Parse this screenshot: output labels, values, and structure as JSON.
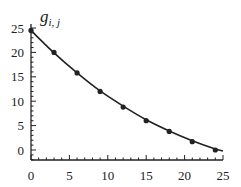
{
  "chart_data": {
    "type": "line",
    "title": "",
    "xlabel": "",
    "ylabel": "g_{i,j}",
    "ylabel_main": "g",
    "ylabel_sub": "i, j",
    "xlim": [
      0,
      25
    ],
    "ylim": [
      -2,
      25
    ],
    "grid": false,
    "legend": "none",
    "x_ticks": [
      0,
      5,
      10,
      15,
      20,
      25
    ],
    "y_ticks": [
      0,
      5,
      10,
      15,
      20,
      25
    ],
    "x_tick_labels": [
      "0",
      "5",
      "10",
      "15",
      "20",
      "25"
    ],
    "y_tick_labels": [
      "0",
      "5",
      "10",
      "15",
      "20",
      "25"
    ],
    "series": [
      {
        "name": "data points",
        "kind": "scatter",
        "x": [
          0,
          3,
          6,
          9,
          12,
          15,
          18,
          21,
          24
        ],
        "values": [
          24.5,
          20.0,
          15.8,
          12.0,
          8.8,
          6.0,
          3.8,
          1.7,
          0.0
        ]
      },
      {
        "name": "fitted curve",
        "kind": "line",
        "x": [
          0,
          3,
          6,
          9,
          12,
          15,
          18,
          21,
          24,
          25
        ],
        "values": [
          24.5,
          19.9,
          15.8,
          12.1,
          9.0,
          6.2,
          3.9,
          1.9,
          0.2,
          -0.2
        ]
      }
    ],
    "colors": {
      "line": "#222222",
      "marker": "#222222",
      "axis": "#222222"
    }
  }
}
